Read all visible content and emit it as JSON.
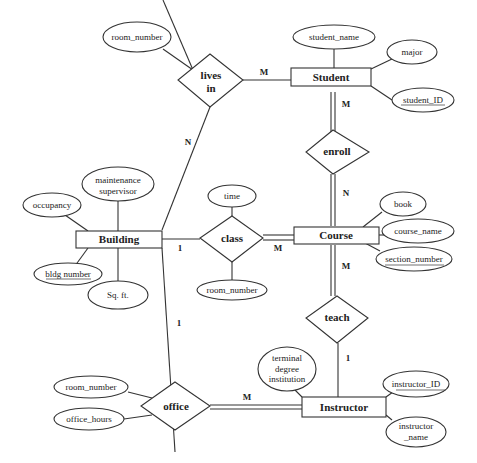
{
  "diagram": {
    "type": "ER diagram",
    "entities": {
      "student": "Student",
      "course": "Course",
      "building": "Building",
      "instructor": "Instructor"
    },
    "relationships": {
      "lives_in_line1": "lives",
      "lives_in_line2": "in",
      "enroll": "enroll",
      "class": "class",
      "teach": "teach",
      "office": "office"
    },
    "attributes": {
      "lives_in_room_number": "room_number",
      "student_name": "student_name",
      "major": "major",
      "student_id": "student_ID",
      "building_maintenance_line1": "maintenance",
      "building_maintenance_line2": "supervisor",
      "building_occupancy": "occupancy",
      "building_bldg_number": "bldg number",
      "building_sqft": "Sq. ft.",
      "class_time": "time",
      "class_room_number": "room_number",
      "course_book": "book",
      "course_name": "course_name",
      "course_section_number": "section_number",
      "office_room_number": "room_number",
      "office_hours": "office_hours",
      "instructor_terminal_line1": "terminal",
      "instructor_terminal_line2": "degree",
      "instructor_terminal_line3": "institution",
      "instructor_id": "instructor_ID",
      "instructor_name_line1": "instructor",
      "instructor_name_line2": "_name"
    },
    "cardinalities": {
      "lives_in_student": "M",
      "lives_in_building": "N",
      "enroll_student": "M",
      "enroll_course": "N",
      "class_building": "1",
      "class_course": "M",
      "teach_course": "M",
      "teach_instructor": "1",
      "office_building": "1",
      "office_instructor": "M"
    },
    "key_attributes": [
      "student_ID",
      "bldg number",
      "section_number",
      "instructor_ID"
    ]
  }
}
